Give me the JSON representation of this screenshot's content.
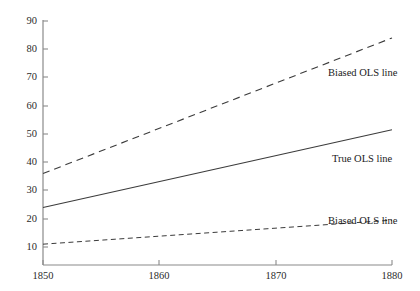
{
  "chart_data": {
    "type": "line",
    "title": "",
    "xlabel": "",
    "ylabel": "",
    "xlim": [
      1850,
      1880
    ],
    "ylim": [
      8,
      90
    ],
    "grid": false,
    "legend_position": "inline-right-of-lines",
    "xticks": [
      1850,
      1860,
      1870,
      1880
    ],
    "xtick_labels": [
      "1850",
      "1860",
      "1870",
      "1880"
    ],
    "yticks": [
      10,
      20,
      30,
      40,
      50,
      60,
      70,
      80,
      90
    ],
    "ytick_labels": [
      "10",
      "20",
      "30",
      "40",
      "50",
      "60",
      "70",
      "80",
      "90"
    ],
    "x": [
      1850,
      1880
    ],
    "series": [
      {
        "name": "Biased OLS line",
        "style": "dashed",
        "values": [
          36,
          84
        ],
        "label_text": "Biased OLS line",
        "color": "#3b3b3b"
      },
      {
        "name": "True OLS line",
        "style": "solid",
        "values": [
          24,
          51.5
        ],
        "label_text": "True OLS line",
        "color": "#3b3b3b"
      },
      {
        "name": "Biased OLS line (lower)",
        "style": "dashed-fine",
        "values": [
          11,
          19.5
        ],
        "label_text": "Biased OLS line",
        "color": "#3b3b3b"
      }
    ],
    "axis_color": "#8a8a8a"
  }
}
